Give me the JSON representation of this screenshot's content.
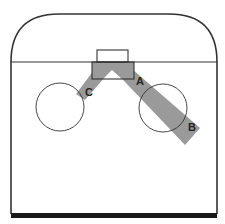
{
  "diagram": {
    "colors": {
      "outline": "#333333",
      "band": "#9a9a9a",
      "background": "#ffffff",
      "floor": "#1a1a1a"
    },
    "labels": {
      "a": "A",
      "b": "B",
      "c": "C"
    }
  }
}
